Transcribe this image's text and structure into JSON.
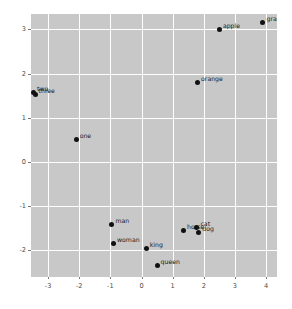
{
  "chart_data": {
    "type": "scatter",
    "title": "",
    "subtitle": "",
    "xlabel": "",
    "ylabel": "",
    "xlim": [
      -3.55,
      4.35
    ],
    "ylim": [
      -2.6,
      3.35
    ],
    "xticks": [
      "-3",
      "-2",
      "-1",
      "0",
      "1",
      "2",
      "3",
      "4"
    ],
    "xtick_values": [
      -3,
      -2,
      -1,
      0,
      1,
      2,
      3,
      4
    ],
    "yticks": [
      "-2",
      "-1",
      "0",
      "1",
      "2",
      "3"
    ],
    "ytick_values": [
      -2,
      -1,
      0,
      1,
      2,
      3
    ],
    "grid": true,
    "legend": "none",
    "point_color": "#111111",
    "panel_color": "#c8c8c8",
    "grid_color": "#ffffff",
    "points": [
      {
        "label": "grape",
        "x": 3.9,
        "y": 3.15
      },
      {
        "label": "apple",
        "x": 2.5,
        "y": 3.0
      },
      {
        "label": "orange",
        "x": 1.8,
        "y": 1.8
      },
      {
        "label": "two",
        "x": -3.47,
        "y": 1.58
      },
      {
        "label": "three",
        "x": -3.42,
        "y": 1.52
      },
      {
        "label": "one",
        "x": -2.1,
        "y": 0.5
      },
      {
        "label": "man",
        "x": -0.95,
        "y": -1.42
      },
      {
        "label": "woman",
        "x": -0.9,
        "y": -1.85
      },
      {
        "label": "king",
        "x": 0.15,
        "y": -1.95
      },
      {
        "label": "queen",
        "x": 0.5,
        "y": -2.35
      },
      {
        "label": "horse",
        "x": 1.35,
        "y": -1.55
      },
      {
        "label": "cat",
        "x": 1.78,
        "y": -1.48
      },
      {
        "label": "dog",
        "x": 1.84,
        "y": -1.6
      }
    ]
  }
}
